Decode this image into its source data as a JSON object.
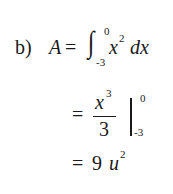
{
  "problem": {
    "label": "b)",
    "line1": {
      "lhs": "A",
      "eq": "=",
      "integral_sign": "∫",
      "upper_limit": "0",
      "lower_limit": "-3",
      "integrand_base": "x",
      "integrand_exp": "2",
      "differential": "dx"
    },
    "line2": {
      "eq": "=",
      "numerator_base": "x",
      "numerator_exp": "3",
      "denominator": "3",
      "upper_limit": "0",
      "lower_limit": "-3"
    },
    "line3": {
      "eq": "=",
      "value": "9",
      "unit_base": "u",
      "unit_exp": "2"
    }
  }
}
